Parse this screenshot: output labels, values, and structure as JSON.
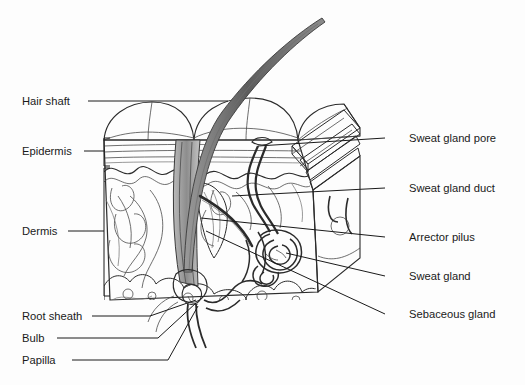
{
  "figure": {
    "background_color": "#fdfdfd",
    "ink_color": "#2b2b2b",
    "panel_gray": "#c8c8c8",
    "top_gray": "#e4e4e4",
    "bulb_gray": "#8f8f8f"
  },
  "labels_left": [
    {
      "id": "hair-shaft",
      "text": "Hair shaft",
      "x": 22,
      "y": 105,
      "line_from_x": 88,
      "line_from_y": 101,
      "line_to_x": 228,
      "line_to_y": 101
    },
    {
      "id": "epidermis",
      "text": "Epidermis",
      "x": 22,
      "y": 155,
      "line_from_x": 84,
      "line_from_y": 151,
      "line_to_x": 104,
      "line_to_y": 151
    },
    {
      "id": "dermis",
      "text": "Dermis",
      "x": 22,
      "y": 235,
      "line_from_x": 68,
      "line_from_y": 231,
      "line_to_x": 104,
      "line_to_y": 231
    },
    {
      "id": "root-sheath",
      "text": "Root sheath",
      "x": 22,
      "y": 320,
      "line_from_x": 92,
      "line_from_y": 316,
      "line_to_x": 196,
      "line_to_y": 300
    },
    {
      "id": "bulb",
      "text": "Bulb",
      "x": 22,
      "y": 342,
      "line_from_x": 57,
      "line_from_y": 338,
      "line_to_x": 196,
      "line_to_y": 303
    },
    {
      "id": "papilla",
      "text": "Papilla",
      "x": 22,
      "y": 364,
      "line_from_x": 72,
      "line_from_y": 360,
      "line_to_x": 198,
      "line_to_y": 306
    }
  ],
  "labels_right": [
    {
      "id": "sweat-gland-pore",
      "text": "Sweat gland pore",
      "x": 409,
      "y": 142,
      "line_from_x": 385,
      "line_from_y": 138,
      "line_to_x": 258,
      "line_to_y": 146
    },
    {
      "id": "sweat-gland-duct",
      "text": "Sweat gland duct",
      "x": 409,
      "y": 192,
      "line_from_x": 385,
      "line_from_y": 188,
      "line_to_x": 232,
      "line_to_y": 196
    },
    {
      "id": "arrector-pilus",
      "text": "Arrector pilus",
      "x": 409,
      "y": 241,
      "line_from_x": 385,
      "line_from_y": 237,
      "line_to_x": 201,
      "line_to_y": 218
    },
    {
      "id": "sweat-gland",
      "text": "Sweat gland",
      "x": 409,
      "y": 280,
      "line_from_x": 385,
      "line_from_y": 276,
      "line_to_x": 286,
      "line_to_y": 253
    },
    {
      "id": "sebaceous-gland",
      "text": "Sebaceous gland",
      "x": 409,
      "y": 318,
      "line_from_x": 385,
      "line_from_y": 314,
      "line_to_x": 206,
      "line_to_y": 231
    }
  ],
  "brackets": [
    {
      "id": "epidermis-bracket",
      "x": 104,
      "y_top": 138,
      "y_bottom": 166,
      "tick": 6
    },
    {
      "id": "dermis-bracket",
      "x": 104,
      "y_top": 166,
      "y_bottom": 296,
      "tick": 6
    }
  ],
  "structures": [
    {
      "id": "hair-shaft-curve",
      "name": "hair shaft"
    },
    {
      "id": "skin-surface-domes",
      "name": "skin surface domes"
    },
    {
      "id": "epidermis-layers",
      "name": "epidermis layers"
    },
    {
      "id": "dermis-papillae",
      "name": "dermal papillae"
    },
    {
      "id": "side-panel",
      "name": "cut side panel with ridges"
    },
    {
      "id": "sweat-gland-coil",
      "name": "sweat gland coil"
    },
    {
      "id": "sweat-duct",
      "name": "sweat duct"
    },
    {
      "id": "hair-follicle",
      "name": "hair follicle root sheath"
    },
    {
      "id": "hair-bulb",
      "name": "hair bulb and papilla"
    },
    {
      "id": "sebaceous-gland",
      "name": "sebaceous gland"
    },
    {
      "id": "arrector-pili-muscle",
      "name": "arrector pili muscle"
    },
    {
      "id": "subcutaneous-fat",
      "name": "subcutaneous fat lobules"
    },
    {
      "id": "blood-vessels",
      "name": "blood vessels"
    }
  ]
}
